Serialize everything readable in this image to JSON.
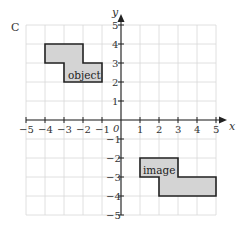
{
  "question_label": "C",
  "axes": {
    "x_label": "x",
    "y_label": "y",
    "origin_label": "0",
    "x_min": -5,
    "x_max": 5,
    "y_min": -5,
    "y_max": 5,
    "x_ticks": [
      "-5",
      "-4",
      "-3",
      "-2",
      "-1",
      "1",
      "2",
      "3",
      "4",
      "5"
    ],
    "y_ticks": [
      "5",
      "4",
      "3",
      "2",
      "1",
      "-1",
      "-2",
      "-3",
      "-4",
      "-5"
    ]
  },
  "shapes": {
    "object": {
      "label": "object",
      "vertices": [
        [
          -4,
          4
        ],
        [
          -2,
          4
        ],
        [
          -2,
          3
        ],
        [
          -1,
          3
        ],
        [
          -1,
          2
        ],
        [
          -3,
          2
        ],
        [
          -3,
          3
        ],
        [
          -4,
          3
        ]
      ],
      "fill": "#d4d4d4"
    },
    "image": {
      "label": "image",
      "vertices": [
        [
          1,
          -2
        ],
        [
          3,
          -2
        ],
        [
          3,
          -3
        ],
        [
          5,
          -3
        ],
        [
          5,
          -4
        ],
        [
          2,
          -4
        ],
        [
          2,
          -3
        ],
        [
          1,
          -3
        ]
      ],
      "fill": "#d4d4d4"
    }
  }
}
